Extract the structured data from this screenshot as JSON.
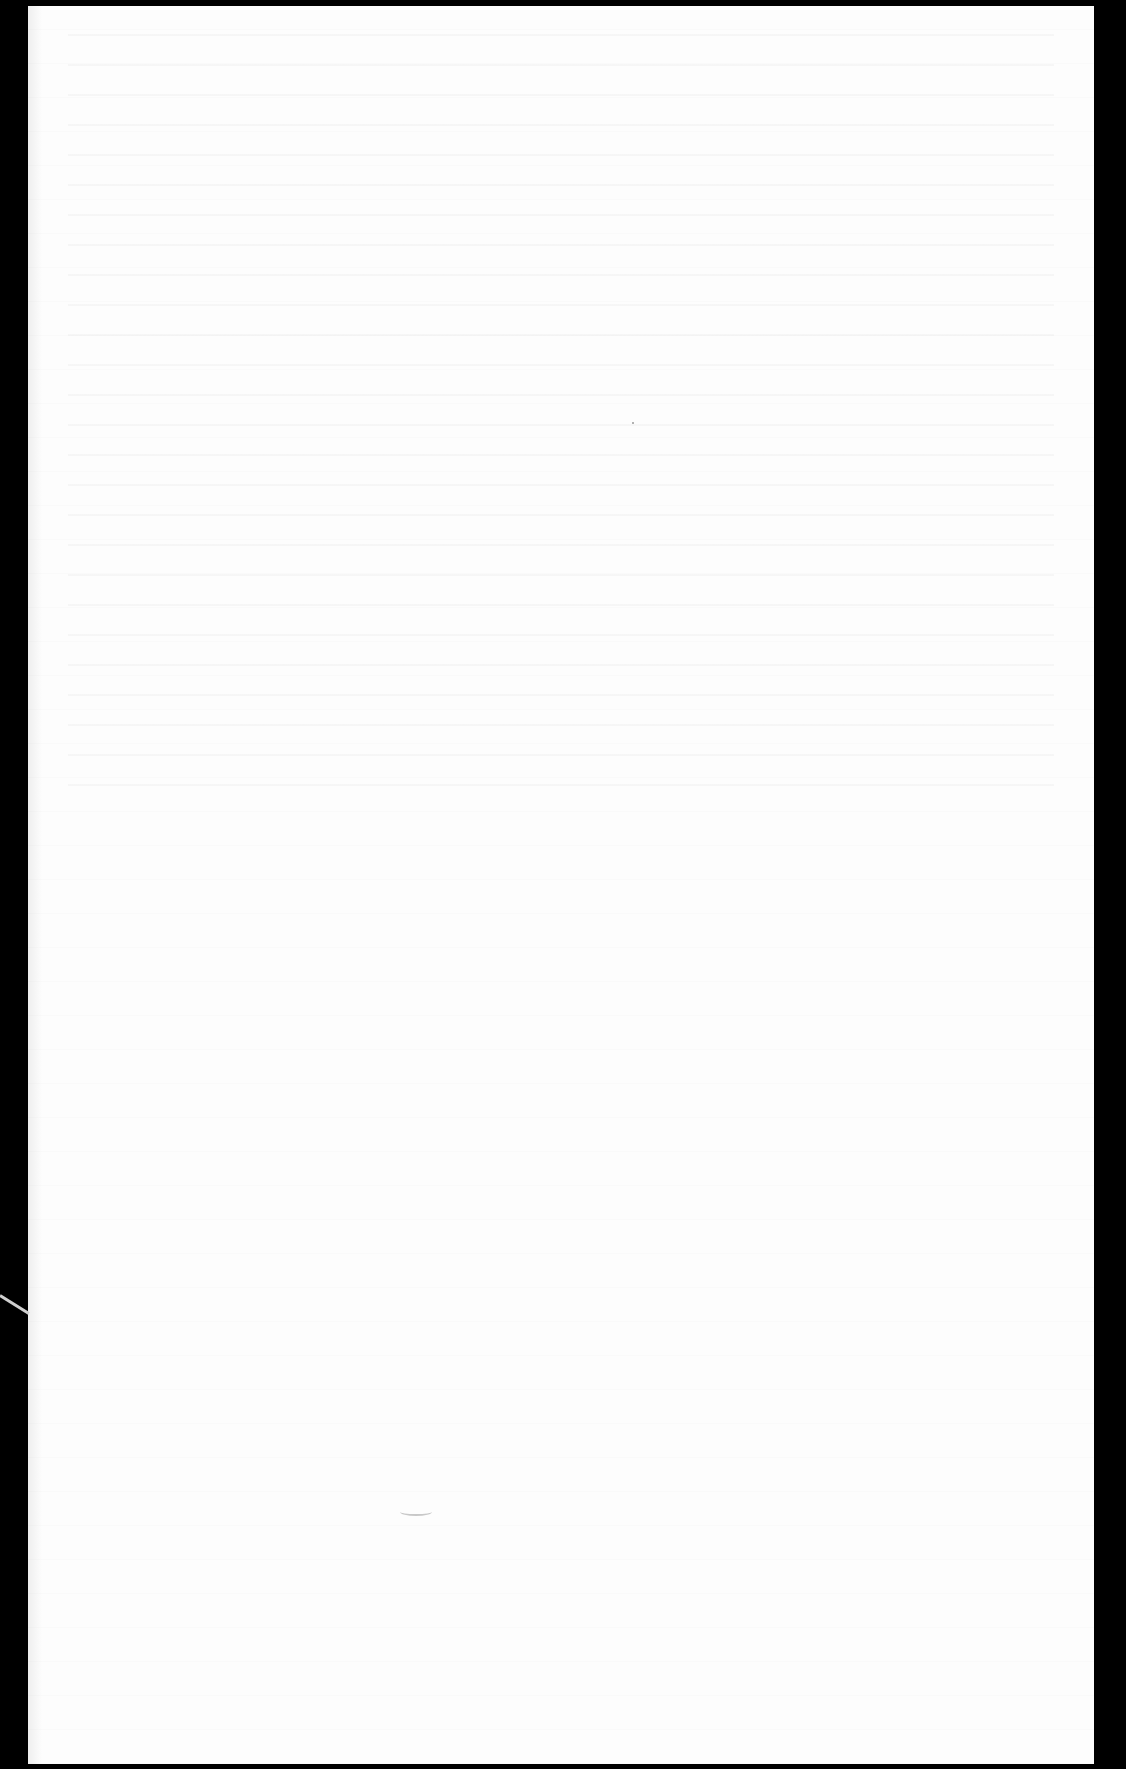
{
  "document": {
    "type": "scanned-page",
    "content": "",
    "page_color": "#fdfdfd",
    "border_color": "#000000"
  }
}
